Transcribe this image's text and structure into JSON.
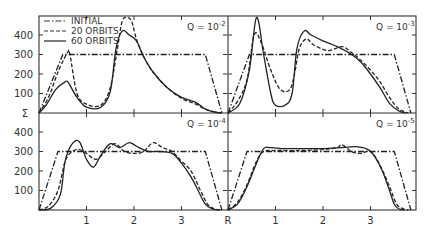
{
  "chart_data": [
    {
      "type": "line",
      "panel": "top-left",
      "title": "Q = 10^-2",
      "annotation": {
        "base": "Q = 10",
        "exp": "-2"
      },
      "xlabel": "R",
      "ylabel": "Σ",
      "xlim": [
        0,
        4
      ],
      "ylim": [
        0,
        490
      ],
      "xticks": [
        1,
        2,
        3
      ],
      "yticks": [
        100,
        200,
        300,
        400
      ],
      "series": [
        {
          "name": "INITIAL",
          "style": "dashdot",
          "x": [
            0,
            0.5,
            3.5,
            3.85
          ],
          "y": [
            0,
            300,
            300,
            0
          ]
        },
        {
          "name": "20 ORBITS",
          "style": "dashed",
          "x": [
            0,
            0.2,
            0.4,
            0.6,
            0.65,
            0.8,
            1.0,
            1.3,
            1.5,
            1.65,
            1.75,
            1.85,
            1.95,
            2.05,
            2.2,
            2.4,
            2.7,
            3.0,
            3.3,
            3.5,
            3.7,
            3.85
          ],
          "y": [
            0,
            80,
            210,
            310,
            300,
            100,
            45,
            40,
            130,
            330,
            470,
            490,
            470,
            380,
            290,
            210,
            130,
            75,
            45,
            20,
            5,
            0
          ]
        },
        {
          "name": "60 ORBITS",
          "style": "solid",
          "x": [
            0,
            0.15,
            0.35,
            0.55,
            0.62,
            0.8,
            1.0,
            1.3,
            1.5,
            1.62,
            1.75,
            1.9,
            2.05,
            2.2,
            2.4,
            2.7,
            3.0,
            3.3,
            3.5,
            3.7,
            3.85
          ],
          "y": [
            0,
            40,
            120,
            160,
            155,
            80,
            30,
            30,
            110,
            330,
            420,
            400,
            370,
            290,
            210,
            130,
            80,
            55,
            20,
            5,
            0
          ]
        }
      ]
    },
    {
      "type": "line",
      "panel": "top-right",
      "title": "Q = 10^-3",
      "annotation": {
        "base": "Q = 10",
        "exp": "-3"
      },
      "xlim": [
        0,
        4
      ],
      "ylim": [
        0,
        490
      ],
      "xticks": [
        1,
        2,
        3
      ],
      "yticks": [
        100,
        200,
        300,
        400
      ],
      "series": [
        {
          "name": "INITIAL",
          "style": "dashdot",
          "x": [
            0,
            0.45,
            3.5,
            3.85
          ],
          "y": [
            0,
            300,
            300,
            0
          ]
        },
        {
          "name": "20 ORBITS",
          "style": "dashed",
          "x": [
            0,
            0.2,
            0.4,
            0.55,
            0.7,
            0.9,
            1.1,
            1.3,
            1.4,
            1.5,
            1.65,
            1.8,
            2.1,
            2.4,
            2.6,
            2.8,
            3.0,
            3.2,
            3.4,
            3.6,
            3.8
          ],
          "y": [
            0,
            60,
            170,
            400,
            360,
            220,
            120,
            120,
            200,
            330,
            380,
            350,
            320,
            340,
            310,
            270,
            220,
            160,
            80,
            20,
            0
          ]
        },
        {
          "name": "60 ORBITS",
          "style": "solid",
          "x": [
            0,
            0.25,
            0.45,
            0.6,
            0.75,
            0.9,
            1.0,
            1.2,
            1.35,
            1.45,
            1.6,
            1.75,
            2.0,
            2.3,
            2.6,
            2.8,
            3.0,
            3.2,
            3.4,
            3.6,
            3.75
          ],
          "y": [
            0,
            50,
            220,
            490,
            300,
            100,
            40,
            40,
            100,
            330,
            420,
            400,
            370,
            340,
            300,
            260,
            200,
            130,
            50,
            10,
            0
          ]
        }
      ]
    },
    {
      "type": "line",
      "panel": "bottom-left",
      "title": "Q = 10^-4",
      "annotation": {
        "base": "Q = 10",
        "exp": "-4"
      },
      "xlim": [
        0,
        4
      ],
      "ylim": [
        0,
        490
      ],
      "xticks": [
        1,
        2,
        3
      ],
      "yticks": [
        100,
        200,
        300,
        400
      ],
      "series": [
        {
          "name": "INITIAL",
          "style": "dashdot",
          "x": [
            0,
            0.4,
            3.5,
            3.85
          ],
          "y": [
            0,
            300,
            300,
            0
          ]
        },
        {
          "name": "20 ORBITS",
          "style": "dashed",
          "x": [
            0,
            0.2,
            0.4,
            0.55,
            0.7,
            0.85,
            1.0,
            1.2,
            1.4,
            1.6,
            1.8,
            2.0,
            2.2,
            2.4,
            2.6,
            2.8,
            3.0,
            3.2,
            3.4,
            3.55,
            3.7,
            3.85
          ],
          "y": [
            0,
            20,
            100,
            250,
            300,
            310,
            290,
            260,
            300,
            340,
            300,
            290,
            300,
            345,
            320,
            300,
            250,
            200,
            100,
            30,
            5,
            0
          ]
        },
        {
          "name": "60 ORBITS",
          "style": "solid",
          "x": [
            0,
            0.25,
            0.45,
            0.55,
            0.7,
            0.85,
            1.0,
            1.15,
            1.3,
            1.5,
            1.7,
            1.9,
            2.1,
            2.3,
            2.5,
            2.8,
            3.0,
            3.2,
            3.35,
            3.5,
            3.65,
            3.8
          ],
          "y": [
            0,
            10,
            80,
            250,
            340,
            350,
            260,
            220,
            280,
            340,
            320,
            345,
            320,
            300,
            300,
            290,
            240,
            170,
            100,
            30,
            5,
            0
          ]
        }
      ]
    },
    {
      "type": "line",
      "panel": "bottom-right",
      "title": "Q = 10^-5",
      "annotation": {
        "base": "Q = 10",
        "exp": "-5"
      },
      "xlim": [
        0,
        4
      ],
      "ylim": [
        0,
        490
      ],
      "xticks": [
        1,
        2,
        3
      ],
      "yticks": [
        100,
        200,
        300,
        400
      ],
      "series": [
        {
          "name": "INITIAL",
          "style": "dashdot",
          "x": [
            0,
            0.4,
            3.5,
            3.85
          ],
          "y": [
            0,
            300,
            300,
            0
          ]
        },
        {
          "name": "20 ORBITS",
          "style": "dashed",
          "x": [
            0,
            0.2,
            0.4,
            0.6,
            0.75,
            1.0,
            1.5,
            2.0,
            2.3,
            2.4,
            2.6,
            2.8,
            3.0,
            3.2,
            3.4,
            3.55,
            3.7,
            3.8
          ],
          "y": [
            0,
            40,
            130,
            250,
            300,
            305,
            305,
            310,
            320,
            335,
            300,
            290,
            300,
            230,
            120,
            30,
            5,
            0
          ]
        },
        {
          "name": "60 ORBITS",
          "style": "solid",
          "x": [
            0,
            0.2,
            0.4,
            0.6,
            0.75,
            0.9,
            1.2,
            1.6,
            2.0,
            2.4,
            2.7,
            2.95,
            3.1,
            3.25,
            3.4,
            3.5,
            3.6,
            3.72
          ],
          "y": [
            0,
            30,
            120,
            240,
            315,
            320,
            315,
            315,
            315,
            320,
            325,
            310,
            270,
            200,
            100,
            30,
            5,
            0
          ]
        }
      ]
    }
  ],
  "legend": {
    "items": [
      {
        "label": "INITIAL",
        "style": "dashdot"
      },
      {
        "label": "20 ORBITS",
        "style": "dashed"
      },
      {
        "label": "60 ORBITS",
        "style": "solid"
      }
    ]
  },
  "axes": {
    "y_tick_labels": [
      "400",
      "300",
      "200",
      "100"
    ],
    "y_axis_symbol": "Σ",
    "x_tick_labels": [
      "1",
      "2",
      "3"
    ],
    "x_axis_symbol": "R"
  },
  "colors": {
    "ink": "#333333",
    "background": "#ffffff"
  }
}
